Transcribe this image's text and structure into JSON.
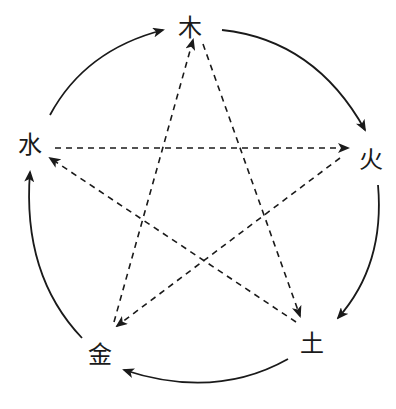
{
  "diagram": {
    "type": "wu-xing-five-elements",
    "nodes": [
      {
        "id": "wood",
        "label": "木",
        "x": 190,
        "y": 28
      },
      {
        "id": "fire",
        "label": "火",
        "x": 371,
        "y": 160
      },
      {
        "id": "earth",
        "label": "土",
        "x": 312,
        "y": 344
      },
      {
        "id": "metal",
        "label": "金",
        "x": 100,
        "y": 355
      },
      {
        "id": "water",
        "label": "水",
        "x": 30,
        "y": 145
      }
    ],
    "generating_cycle": {
      "style": "solid-curved",
      "edges": [
        {
          "from": "木",
          "to": "火"
        },
        {
          "from": "火",
          "to": "土"
        },
        {
          "from": "土",
          "to": "金"
        },
        {
          "from": "金",
          "to": "水"
        },
        {
          "from": "水",
          "to": "木"
        }
      ]
    },
    "controlling_cycle": {
      "style": "dashed-straight",
      "edges": [
        {
          "from": "木",
          "to": "土"
        },
        {
          "from": "土",
          "to": "水"
        },
        {
          "from": "水",
          "to": "火"
        },
        {
          "from": "火",
          "to": "金"
        },
        {
          "from": "金",
          "to": "木"
        }
      ]
    },
    "colors": {
      "line": "#1a1a1a",
      "background": "#ffffff"
    }
  }
}
